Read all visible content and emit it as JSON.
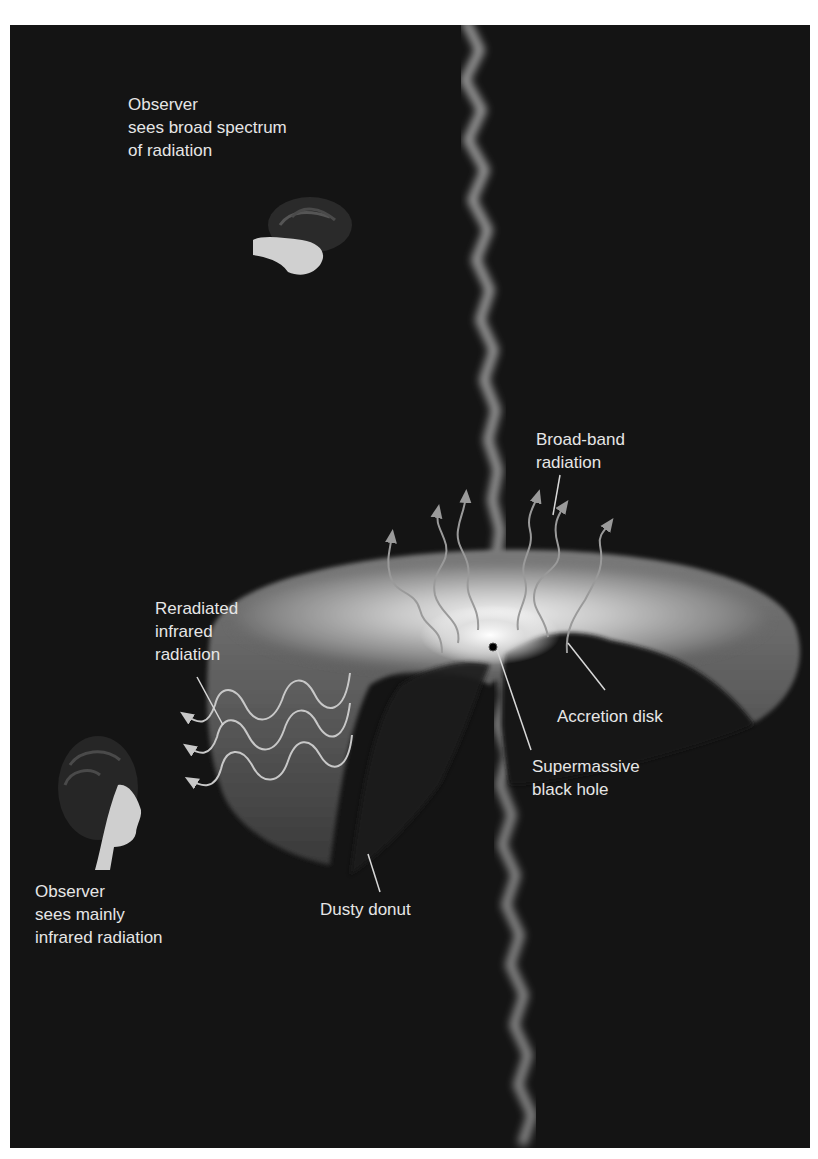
{
  "figure": {
    "background_color": "#141414",
    "text_color": "#e6e6e6",
    "labels": {
      "observer_top": "Observer\nsees broad spectrum\nof radiation",
      "broad_band": "Broad-band\nradiation",
      "reradiated": "Reradiated\ninfrared\nradiation",
      "accretion_disk": "Accretion disk",
      "black_hole": "Supermassive\nblack hole",
      "dusty_donut": "Dusty donut",
      "observer_side": "Observer\nsees mainly\ninfrared radiation"
    },
    "elements": {
      "observer_top_icon": "observer-face-looking-down",
      "observer_side_icon": "observer-face-looking-right",
      "jet_icon": "relativistic-jet",
      "black_hole_icon": "black-hole-dot"
    }
  }
}
